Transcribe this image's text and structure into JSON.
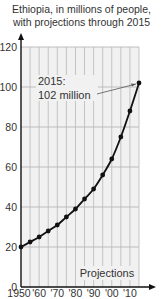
{
  "chart_data": {
    "type": "line",
    "title": "Ethiopia, in millions of people,",
    "subtitle": "with projections through 2015",
    "xlabel": "",
    "ylabel": "",
    "x": [
      1950,
      1955,
      1960,
      1965,
      1970,
      1975,
      1980,
      1985,
      1990,
      1995,
      2000,
      2005,
      2010,
      2015
    ],
    "series": [
      {
        "name": "Population (millions)",
        "values": [
          20,
          22.5,
          25,
          28,
          31,
          35,
          39,
          44,
          49,
          56,
          64,
          75,
          88,
          102
        ]
      }
    ],
    "x_tick_labels": [
      "1950",
      "'60",
      "'70",
      "'80",
      "'90",
      "'00",
      "'10"
    ],
    "y_ticks": [
      0,
      20,
      40,
      60,
      80,
      100,
      120
    ],
    "ylim": [
      0,
      120
    ],
    "xlim": [
      1950,
      2015
    ],
    "grid": true,
    "annotations": [
      {
        "text_line1": "2015:",
        "text_line2": "102 million",
        "target_x": 2015,
        "target_y": 102
      },
      {
        "text": "Projections"
      }
    ],
    "colors": {
      "line": "#111111",
      "grid": "#b8b8b8",
      "plot_bg": "#f1f1f1"
    }
  }
}
